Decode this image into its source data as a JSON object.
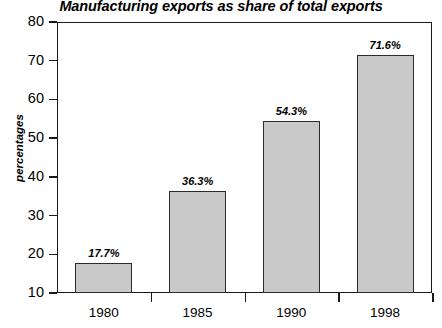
{
  "chart_data": {
    "type": "bar",
    "title": "Manufacturing exports as share of total exports",
    "xlabel": "",
    "ylabel": "percentages",
    "categories": [
      "1980",
      "1985",
      "1990",
      "1998"
    ],
    "values": [
      17.7,
      36.3,
      54.3,
      71.6
    ],
    "value_labels": [
      "17.7%",
      "36.3%",
      "54.3%",
      "71.6%"
    ],
    "ylim": [
      10,
      80
    ],
    "yticks": [
      10,
      20,
      30,
      40,
      50,
      60,
      70,
      80
    ],
    "ytick_labels": [
      "10",
      "20",
      "30",
      "40",
      "50",
      "60",
      "70",
      "80"
    ],
    "grid": false,
    "legend": false,
    "legend_position": "none",
    "bar_color": "#c9c9c9",
    "bar_edge_color": "#2b2b2b",
    "axis_color": "#1a1a1a",
    "background_color": "#ffffff"
  }
}
